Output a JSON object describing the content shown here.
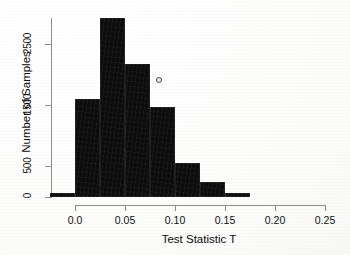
{
  "chart_data": {
    "type": "bar",
    "title": "",
    "subtitle": "",
    "xlabel": "Test Statistic T",
    "ylabel": "Number of Samples",
    "bin_width": 0.025,
    "bin_edges": [
      -0.025,
      0.0,
      0.025,
      0.05,
      0.075,
      0.1,
      0.125,
      0.15,
      0.175
    ],
    "categories": [
      "-0.025-0.000",
      "0.000-0.025",
      "0.025-0.050",
      "0.050-0.075",
      "0.075-0.100",
      "0.100-0.125",
      "0.125-0.150",
      "0.150-0.175"
    ],
    "values": [
      70,
      1610,
      2930,
      2180,
      1480,
      560,
      250,
      60
    ],
    "xlim": [
      -0.03,
      0.26
    ],
    "ylim": [
      0,
      3050
    ],
    "xticks": [
      0.0,
      0.05,
      0.1,
      0.15,
      0.2,
      0.25
    ],
    "xtick_labels": [
      "0.0",
      "0.05",
      "0.10",
      "0.15",
      "0.20",
      "0.25"
    ],
    "yticks": [
      0,
      500,
      1500,
      2500
    ],
    "ytick_labels": [
      "0",
      "500",
      "1500",
      "2500"
    ],
    "grid": false,
    "legend": null,
    "bar_color": "#0c0c0c",
    "axis_color": "#8d8d8d",
    "text_color": "#111111"
  },
  "axes": {
    "y_title": "Number of Samples",
    "x_title": "Test Statistic T"
  }
}
